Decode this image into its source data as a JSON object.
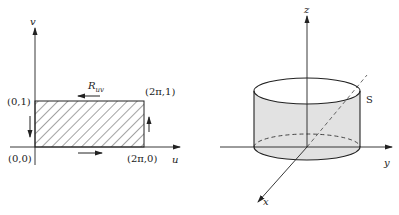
{
  "left_panel": {
    "axis_u_label": "u",
    "axis_v_label": "v",
    "region_label_base": "R",
    "region_label_sub": "uv",
    "corners": {
      "origin": "(0,0)",
      "top_left": "(0,1)",
      "top_right": "(2π,1)",
      "bottom_right": "(2π,0)"
    },
    "boundary_orientation": [
      "bottom: right",
      "right: up",
      "top: left",
      "left: down"
    ]
  },
  "right_panel": {
    "axis_x_label": "x",
    "axis_y_label": "y",
    "axis_z_label": "z",
    "surface_label": "S",
    "shape": "cylinder"
  },
  "colors": {
    "line": "#222222",
    "fill_surface": "#e2e2e2",
    "hatch": "#333333"
  }
}
